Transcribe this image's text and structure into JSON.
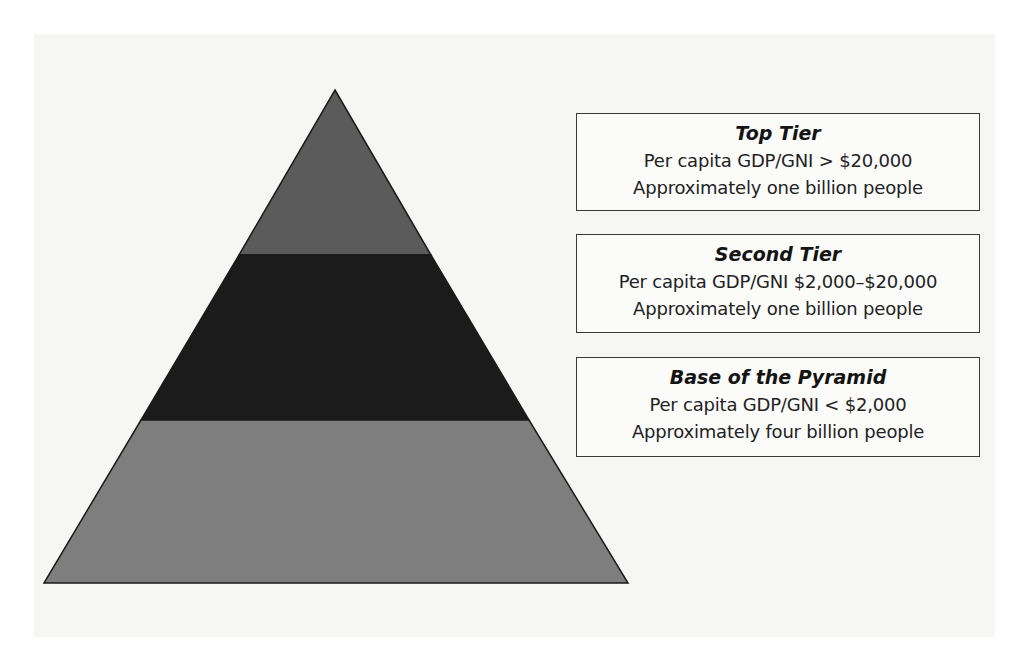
{
  "diagram": {
    "type": "pyramid",
    "colors": {
      "page_background": "#ffffff",
      "panel_background": "#f6f6f4",
      "top_tier_fill": "#5b5b5b",
      "second_tier_fill": "#1b1b1b",
      "base_tier_fill": "#7e7e7e",
      "outline": "#1a1a1a"
    },
    "tiers": [
      {
        "id": "top",
        "title": "Top Tier",
        "income_line": "Per capita GDP/GNI > $20,000",
        "population_line": "Approximately one billion people"
      },
      {
        "id": "second",
        "title": "Second Tier",
        "income_line": "Per capita GDP/GNI $2,000–$20,000",
        "population_line": "Approximately one billion people"
      },
      {
        "id": "base",
        "title": "Base of the Pyramid",
        "income_line": "Per capita GDP/GNI < $2,000",
        "population_line": "Approximately four billion people"
      }
    ]
  }
}
